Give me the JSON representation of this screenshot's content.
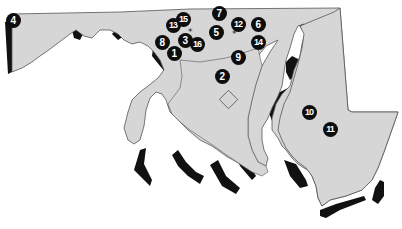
{
  "map": {
    "region": "Maryland",
    "colors": {
      "land": "#d6d6d6",
      "shadow": "#111111",
      "border": "#555555",
      "water": "#ffffff",
      "marker_fill": "#0d0d0d",
      "marker_text": "#ffffff"
    },
    "markers": [
      {
        "id": "1",
        "label": "1",
        "x": 174,
        "y": 53
      },
      {
        "id": "2",
        "label": "2",
        "x": 222,
        "y": 76
      },
      {
        "id": "3",
        "label": "3",
        "x": 185,
        "y": 40
      },
      {
        "id": "4",
        "label": "4",
        "x": 13,
        "y": 20
      },
      {
        "id": "5",
        "label": "5",
        "x": 216,
        "y": 32
      },
      {
        "id": "6",
        "label": "6",
        "x": 258,
        "y": 24
      },
      {
        "id": "7",
        "label": "7",
        "x": 219,
        "y": 13
      },
      {
        "id": "8",
        "label": "8",
        "x": 162,
        "y": 42
      },
      {
        "id": "9",
        "label": "9",
        "x": 238,
        "y": 57
      },
      {
        "id": "10",
        "label": "10",
        "x": 309,
        "y": 112
      },
      {
        "id": "11",
        "label": "11",
        "x": 330,
        "y": 129
      },
      {
        "id": "12",
        "label": "12",
        "x": 238,
        "y": 24
      },
      {
        "id": "13",
        "label": "13",
        "x": 173,
        "y": 25
      },
      {
        "id": "14",
        "label": "14",
        "x": 258,
        "y": 42
      },
      {
        "id": "15",
        "label": "15",
        "x": 183,
        "y": 19
      },
      {
        "id": "16",
        "label": "16",
        "x": 197,
        "y": 44
      }
    ],
    "asterisks": [
      {
        "symbol": "*",
        "x": 191,
        "y": 31
      },
      {
        "symbol": "*",
        "x": 235,
        "y": 33
      }
    ]
  }
}
